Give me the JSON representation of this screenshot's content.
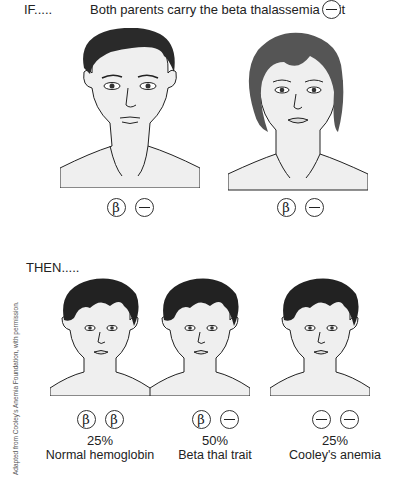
{
  "header": {
    "if_label": "IF.....",
    "premise": "Both parents carry the beta thalassemia trait",
    "premise_symbol": "minus"
  },
  "parents": [
    {
      "figure": "adult-male-face",
      "alleles": [
        "β",
        "−"
      ]
    },
    {
      "figure": "adult-female-face",
      "alleles": [
        "β",
        "−"
      ]
    }
  ],
  "then_label": "THEN.....",
  "children": [
    {
      "figure": "child-face",
      "alleles": [
        "β",
        "β"
      ],
      "percent": "25%",
      "outcome": "Normal hemoglobin"
    },
    {
      "figure": "child-face",
      "alleles": [
        "β",
        "−"
      ],
      "percent": "50%",
      "outcome": "Beta thal trait"
    },
    {
      "figure": "child-face",
      "alleles": [
        "−",
        "−"
      ],
      "percent": "25%",
      "outcome": "Cooley's anemia"
    }
  ],
  "credit": "Adapted from Cooley's Anemia Foundation, with permission.",
  "colors": {
    "hair_dark": "#2a2a2a",
    "hair_female": "#555555",
    "skin": "#efefef",
    "line": "#222222"
  }
}
